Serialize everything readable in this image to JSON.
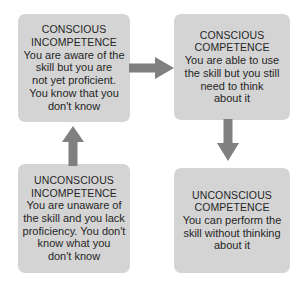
{
  "diagram": {
    "colors": {
      "box_fill": "#d4d4d4",
      "text": "#262626",
      "arrow": "#808080",
      "background": "#ffffff"
    },
    "boxes": [
      {
        "id": "conscious-incompetence",
        "heading": [
          "CONSCIOUS",
          "INCOMPETENCE"
        ],
        "body": [
          "You are aware of the",
          "skill but you are",
          "not yet proficient.",
          "You know that you",
          "don't know"
        ]
      },
      {
        "id": "conscious-competence",
        "heading": [
          "CONSCIOUS",
          "COMPETENCE"
        ],
        "body": [
          "You are able to use",
          "the skill but you still",
          "need to think",
          "about it"
        ]
      },
      {
        "id": "unconscious-incompetence",
        "heading": [
          "UNCONSCIOUS",
          "INCOMPETENCE"
        ],
        "body": [
          "You are unaware of",
          "the skill and you lack",
          "proficiency. You don't",
          "know what you",
          "don't know"
        ]
      },
      {
        "id": "unconscious-competence",
        "heading": [
          "UNCONSCIOUS",
          "COMPETENCE"
        ],
        "body": [
          "You can perform the",
          "skill without thinking",
          "about it"
        ]
      }
    ],
    "arrows": [
      {
        "id": "arrow-up",
        "direction": "up",
        "from": "unconscious-incompetence",
        "to": "conscious-incompetence"
      },
      {
        "id": "arrow-right",
        "direction": "right",
        "from": "conscious-incompetence",
        "to": "conscious-competence"
      },
      {
        "id": "arrow-down",
        "direction": "down",
        "from": "conscious-competence",
        "to": "unconscious-competence"
      }
    ]
  }
}
